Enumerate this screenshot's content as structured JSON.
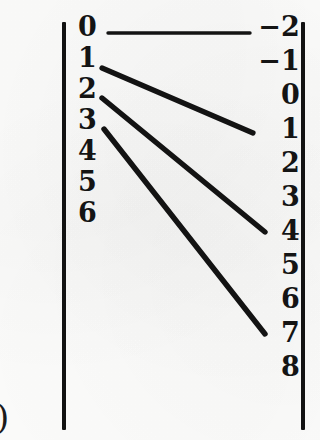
{
  "figure": {
    "background_color": "#fdfdfc",
    "ink_color": "#131313",
    "page_artifact_glyph": ")"
  },
  "brackets": {
    "left_rule_label": "left-bracket-rule",
    "right_rule_label": "right-bracket-rule"
  },
  "chart_data": {
    "type": "diagram",
    "xlabel": "",
    "ylabel": "",
    "domain_label": "",
    "codomain_label": "",
    "domain": [
      "0",
      "1",
      "2",
      "3",
      "4",
      "5",
      "6"
    ],
    "codomain": [
      "−2",
      "−1",
      "0",
      "1",
      "2",
      "3",
      "4",
      "5",
      "6",
      "7",
      "8"
    ],
    "mappings": [
      {
        "from": "0",
        "to": "−2",
        "x1": 108,
        "y1": 33,
        "x2": 250,
        "y2": 33,
        "width": 3.4
      },
      {
        "from": "1",
        "to": "1",
        "x1": 102,
        "y1": 68,
        "x2": 253,
        "y2": 133,
        "width": 5.2
      },
      {
        "from": "2",
        "to": "4",
        "x1": 102,
        "y1": 98,
        "x2": 265,
        "y2": 232,
        "width": 5.4
      },
      {
        "from": "3",
        "to": "7",
        "x1": 104,
        "y1": 129,
        "x2": 265,
        "y2": 334,
        "width": 5.4
      }
    ],
    "legend": [],
    "grid": false
  }
}
